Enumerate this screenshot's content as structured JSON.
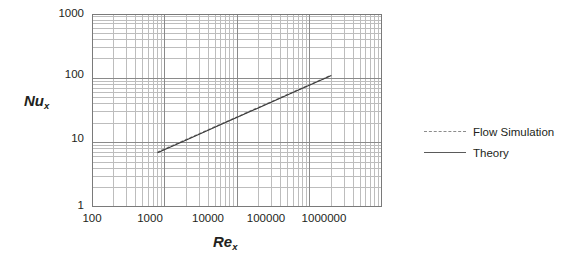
{
  "chart_data": {
    "type": "line",
    "title": "",
    "xlabel": "Re_x",
    "ylabel": "Nu_x",
    "xscale": "log",
    "yscale": "log",
    "xlim": [
      100,
      1000000
    ],
    "ylim": [
      1,
      1000
    ],
    "grid": "both-major-and-minor",
    "legend_position": "right",
    "xticks": [
      "100",
      "1000",
      "10000",
      "100000",
      "1000000"
    ],
    "xtick_values": [
      100,
      1000,
      10000,
      100000,
      1000000
    ],
    "yticks": [
      "1",
      "10",
      "100",
      "1000"
    ],
    "ytick_values": [
      1,
      10,
      100,
      1000
    ],
    "series": [
      {
        "name": "Flow Simulation",
        "style": "dashed",
        "color": "#8c8c8c",
        "x": [
          800,
          2000,
          6000,
          20000,
          60000,
          200000
        ],
        "y": [
          7.1,
          11.2,
          19.4,
          35.5,
          61.5,
          112.0
        ]
      },
      {
        "name": "Theory",
        "style": "solid",
        "color": "#3a3a3a",
        "x": [
          800,
          2000,
          6000,
          20000,
          60000,
          200000
        ],
        "y": [
          7.0,
          11.0,
          19.2,
          35.0,
          61.0,
          111.0
        ]
      }
    ],
    "annotations": []
  },
  "axes": {
    "y_title": "Nu",
    "y_title_sub": "x",
    "x_title": "Re",
    "x_title_sub": "x"
  },
  "legend": {
    "items": [
      {
        "label": "Flow Simulation",
        "style": "dashed"
      },
      {
        "label": "Theory",
        "style": "solid"
      }
    ]
  },
  "colors": {
    "major_grid": "#8a8a8a",
    "minor_grid": "#bdbdbd",
    "frame": "#7a7a7a",
    "theory_line": "#3a3a3a",
    "simulation_line": "#8c8c8c",
    "text": "#231f20",
    "background": "#ffffff"
  }
}
